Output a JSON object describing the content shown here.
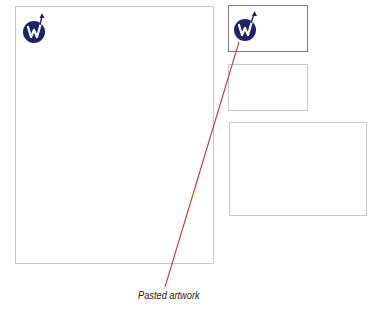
{
  "diagram": {
    "pages": [
      {
        "id": "main-page",
        "description": "letter page",
        "has_logo": true
      },
      {
        "id": "business-card",
        "description": "small card (selected)",
        "has_logo": true
      },
      {
        "id": "middle-card",
        "description": "small blank card",
        "has_logo": false
      },
      {
        "id": "large-card",
        "description": "large blank card",
        "has_logo": false
      }
    ],
    "logo": {
      "glyph": "W",
      "circle_color": "#1f2266",
      "glyph_color": "#ffffff"
    },
    "callout": {
      "label": "Pasted artwork",
      "line_color": "#c0392b"
    }
  }
}
